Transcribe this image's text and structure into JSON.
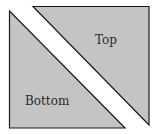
{
  "diagram": {
    "fill_color": "#c4c4c4",
    "stroke_color": "#1a1a1a",
    "top": {
      "label": "Top"
    },
    "bottom": {
      "label": "Bottom"
    }
  }
}
